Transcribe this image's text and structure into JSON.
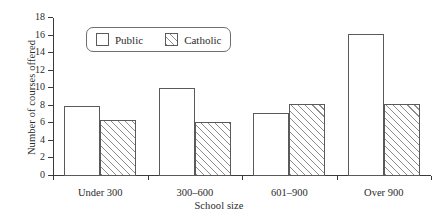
{
  "chart_data": {
    "type": "bar",
    "title": "",
    "xlabel": "School size",
    "ylabel": "Number of courses offered",
    "categories": [
      "Under 300",
      "300–600",
      "601–900",
      "Over 900"
    ],
    "series": [
      {
        "name": "Public",
        "values": [
          8,
          10,
          7.2,
          16.2
        ]
      },
      {
        "name": "Catholic",
        "values": [
          6.4,
          6.2,
          8.2,
          8.2
        ]
      }
    ],
    "ylim": [
      0,
      18
    ],
    "ytick_values": [
      0,
      2,
      4,
      6,
      8,
      10,
      12,
      14,
      16,
      18
    ],
    "ytick_labels": [
      "0",
      "2",
      "4",
      "6",
      "8",
      "10",
      "12",
      "14",
      "16",
      "18"
    ],
    "grid": false,
    "legend_position": "upper-left-inside",
    "legend": [
      {
        "label": "Public",
        "fill": "none",
        "swatch": "empty-square-swatch"
      },
      {
        "label": "Catholic",
        "fill": "hatch",
        "swatch": "hatched-square-swatch"
      }
    ],
    "colors": {
      "background": "#ffffff",
      "axis": "#3a3a3a",
      "bar_outline": "#5a5a5a",
      "hatch": "#8c8c8c",
      "text": "#2b2b2b"
    }
  }
}
